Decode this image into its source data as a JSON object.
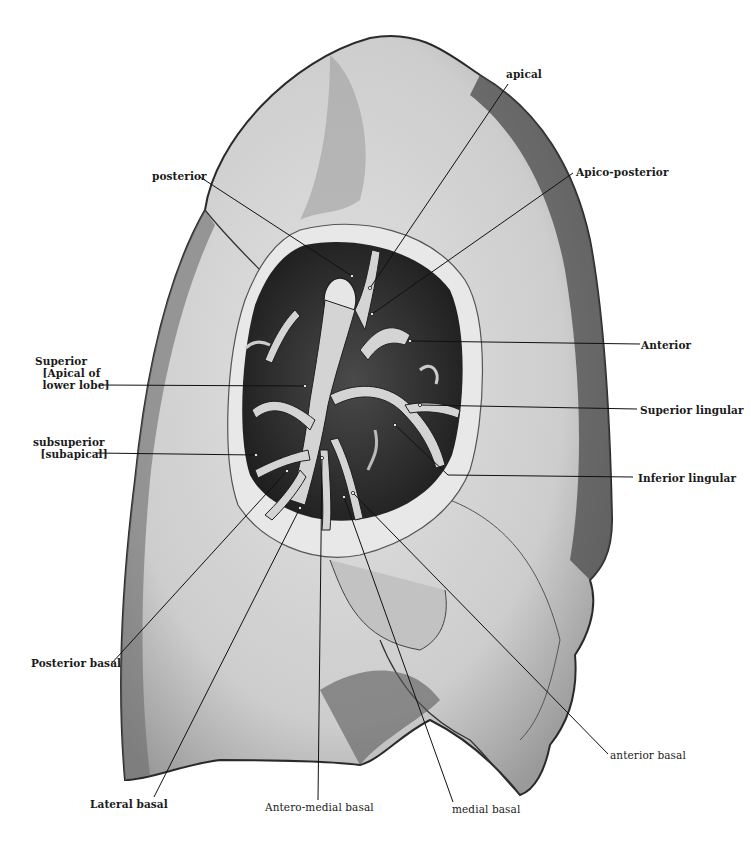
{
  "figure": {
    "colors": {
      "background": "#ffffff",
      "lung_surface": "#d6d6d6",
      "lung_shadow": "#3a3a3a",
      "cavity": "#262626",
      "bronchus": "#cfcfcf",
      "leader_line": "#111111",
      "label_text": "#1a1a1a"
    }
  },
  "labels": {
    "apical": "apical",
    "apico_posterior": "Apico-posterior",
    "posterior": "posterior",
    "anterior": "Anterior",
    "superior": "Superior\n  [Apical of\n  lower lobe]",
    "superior_lingular": "Superior lingular",
    "subsuperior": "subsuperior\n  [subapical]",
    "inferior_lingular": "Inferior lingular",
    "posterior_basal": "Posterior basal",
    "anterior_basal": "anterior basal",
    "lateral_basal": "Lateral basal",
    "antero_medial_basal": "Antero-medial basal",
    "medial_basal": "medial basal"
  }
}
